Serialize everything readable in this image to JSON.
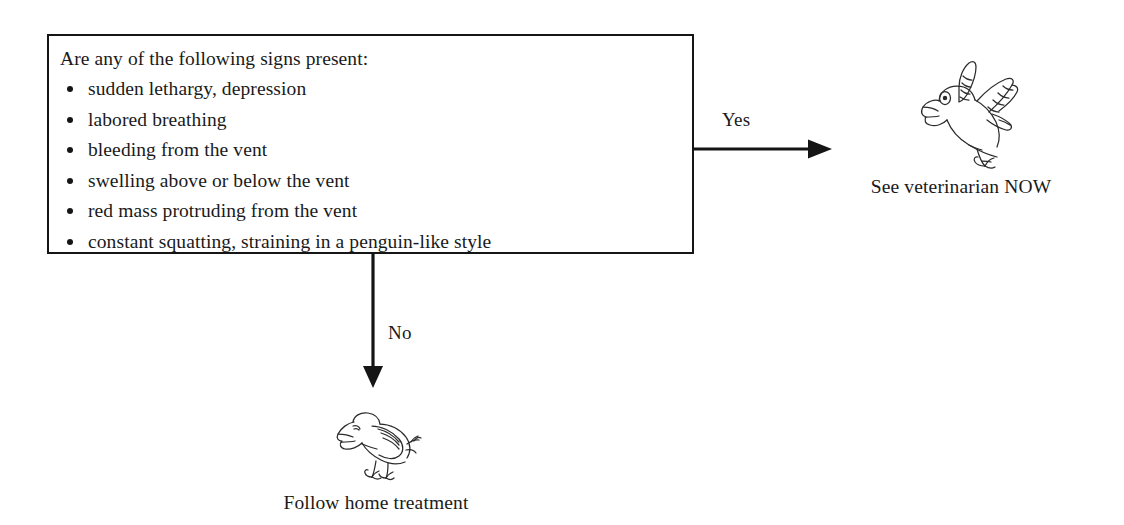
{
  "diagram": {
    "background_color": "#ffffff",
    "line_color": "#151515",
    "decision": {
      "prompt": "Are any of the following signs present:",
      "signs": [
        "sudden lethargy, depression",
        "labored breathing",
        "bleeding from the vent",
        "swelling above or below the vent",
        "red mass protruding from the vent",
        "constant squatting, straining in a penguin-like style"
      ]
    },
    "edges": [
      {
        "label": "Yes",
        "direction": "right",
        "target": "See veterinarian NOW"
      },
      {
        "label": "No",
        "direction": "down",
        "target": "Follow home treatment"
      }
    ],
    "outcomes": [
      {
        "id": "vet",
        "icon": "alarmed-bird-icon",
        "caption": "See veterinarian NOW"
      },
      {
        "id": "home",
        "icon": "resting-bird-icon",
        "caption": "Follow home treatment"
      }
    ]
  }
}
